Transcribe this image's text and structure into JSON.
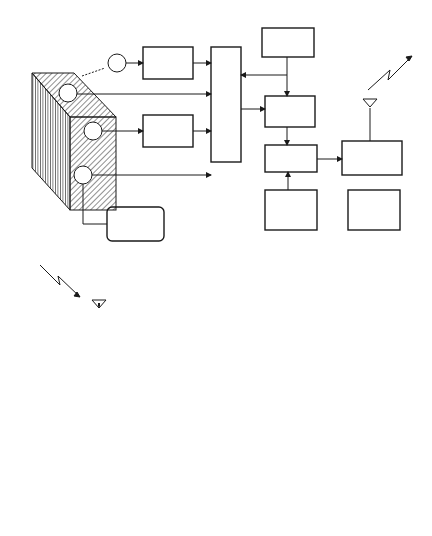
{
  "panel_a": {
    "label": "A",
    "object_label": "Object",
    "sensor_label": "Sensor",
    "sensors": [
      "1",
      "2",
      "3",
      "4"
    ],
    "blocks": {
      "interface_1": "Interface",
      "interface_2": "Interface",
      "multiplexer": "Multiplexer",
      "controller": "Controller",
      "sub_modulator": "Sub-\nModulator",
      "rf_modulator": "RF-\nModulator",
      "rf_oscillator": "RF-\nOscillator",
      "radio_transmitter": "Radio-\nTransmitter",
      "power_supply": "Power\nSupply",
      "excitation_circuit": "Excitation\nCircuit"
    }
  },
  "receiver_chain": {
    "radio_receiver": "Radio-\nReceiver",
    "demodulator": "Demodulator",
    "demultiplexer": "Demultiplexer",
    "data_recorder": "Data Recorder"
  },
  "panel_b": {
    "label": "B",
    "rows": {
      "sensor1": "sensor\n1",
      "sensor2": "sensor\n2",
      "mux": "MUX",
      "rf_modulator": "RF-\nModulator"
    },
    "slot_labels": [
      {
        "a": "1",
        "b": "2"
      },
      {
        "a": "1",
        "b": "2"
      },
      {
        "a": "1",
        "b": "2"
      },
      {
        "a": "1",
        "b": "2"
      }
    ]
  },
  "colors": {
    "line": "#1a1a1a",
    "background": "#ffffff"
  }
}
